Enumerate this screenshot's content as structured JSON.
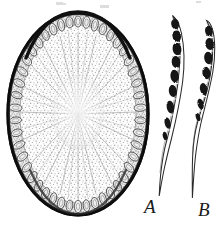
{
  "plate": {
    "title": "Fungal fruiting body cross-section and asci",
    "background_color": "#ffffff",
    "ink_color": "#1a1a1a",
    "width": 221,
    "height": 235
  },
  "figures": [
    {
      "id": "A",
      "label": "A",
      "name": "stroma-cross-section",
      "description": "Oval cross-section of a fungal stroma showing a dark outer cortex, a peripheral ring of embedded ovoid perithecial chambers, and a finely stippled interior with radiating hyphal lines",
      "label_position": {
        "x": 144,
        "y": 197
      },
      "outline": {
        "center_x": 78,
        "center_y": 114,
        "radius_x": 70,
        "radius_y": 101,
        "rim_thickness": 3,
        "rim_color": "#1f1f1f"
      },
      "chamber_count": 46,
      "interior_fill": "#fbfbfb",
      "stipple_color": "#8a8a8a",
      "radiating_line_color": "#9a9a9a"
    },
    {
      "id": "B",
      "label": "B",
      "name": "asci-pair",
      "description": "Two elongated clavate asci, each containing a row of dark irregular ascospores and tapering to a long slender stalk",
      "label_position": {
        "x": 198,
        "y": 200
      },
      "asci": [
        {
          "name": "ascus-left",
          "apex_x": 172,
          "apex_y": 15,
          "base_x": 160,
          "base_y": 196,
          "spore_count": 7,
          "spore_color": "#171717",
          "wall_color": "#2a2a2a"
        },
        {
          "name": "ascus-right",
          "apex_x": 206,
          "apex_y": 20,
          "base_x": 196,
          "base_y": 198,
          "spore_count": 5,
          "spore_color": "#171717",
          "wall_color": "#2a2a2a"
        }
      ]
    }
  ],
  "colors": {
    "paper": "#ffffff",
    "ink_dark": "#1a1a1a",
    "ink_mid": "#6d6d6d",
    "ink_light": "#b5b5b5",
    "cortex": "#2b2b2b",
    "chamber_outline": "#4a4a4a",
    "chamber_fill": "#efefef"
  },
  "artifacts": {
    "description": "Faint scanner residue from text cropped above the plate",
    "specks": [
      {
        "x": 56,
        "y": 2,
        "w": 7,
        "h": 3
      },
      {
        "x": 62,
        "y": 3,
        "w": 4,
        "h": 2
      },
      {
        "x": 100,
        "y": 5,
        "w": 9,
        "h": 3
      },
      {
        "x": 196,
        "y": 1,
        "w": 5,
        "h": 2
      }
    ]
  }
}
